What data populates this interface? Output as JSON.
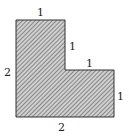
{
  "diagram": {
    "shape": "L-shaped region (hatched)",
    "fill_color": "#9a9a9a",
    "stroke_color": "#333333",
    "labels": {
      "top": "1",
      "inner_vertical": "1",
      "inner_horizontal": "1",
      "right": "1",
      "left": "2",
      "bottom": "2"
    }
  }
}
